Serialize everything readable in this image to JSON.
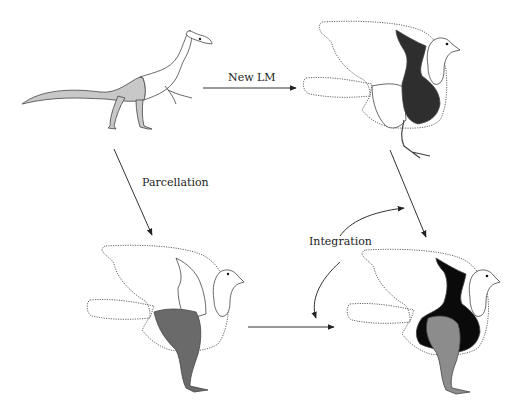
{
  "diagram": {
    "labels": {
      "new_lm": "New LM",
      "parcellation": "Parcellation",
      "integration": "Integration"
    },
    "colors": {
      "background": "#ffffff",
      "light_gray_module": "#c8c8c8",
      "dark_module": "#2e2e2e",
      "mid_gray_module": "#6a6a6a",
      "black_module": "#0a0a0a",
      "gray_legs": "#8c8c8c",
      "outline": "#444444"
    },
    "panels": [
      {
        "id": "ancestral-dinosaur",
        "position": "top-left",
        "description": "Theropod dinosaur with shaded pelvis/tail/hindlimb region"
      },
      {
        "id": "bird-new-lm",
        "position": "top-right",
        "description": "Bird with dark forelimb/torso module, dotted outline of wing and tail"
      },
      {
        "id": "bird-parcellation",
        "position": "bottom-left",
        "description": "Bird with gray hindlimb module, dotted outline of wing and tail"
      },
      {
        "id": "bird-integration",
        "position": "bottom-right",
        "description": "Bird with black forelimb/torso and gray hindlimb modules"
      }
    ],
    "arrows": [
      {
        "from": "ancestral-dinosaur",
        "to": "bird-new-lm",
        "label": "New LM"
      },
      {
        "from": "ancestral-dinosaur",
        "to": "bird-parcellation",
        "label": "Parcellation"
      },
      {
        "from": "bird-new-lm",
        "to": "bird-integration",
        "label": ""
      },
      {
        "from": "bird-parcellation",
        "to": "bird-integration",
        "label": ""
      },
      {
        "from": "integration-curve",
        "to": "both",
        "label": "Integration"
      }
    ]
  }
}
